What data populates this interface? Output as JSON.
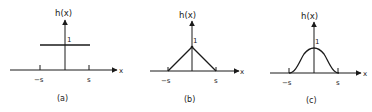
{
  "figure": {
    "panels": [
      {
        "id": "a",
        "caption": "(a)",
        "ylabel": "h(x)",
        "xlabel": "x",
        "peak_label": "1",
        "tick_neg": "−s",
        "tick_pos": "s",
        "shape": "rectangular"
      },
      {
        "id": "b",
        "caption": "(b)",
        "ylabel": "h(x)",
        "xlabel": "x",
        "peak_label": "1",
        "tick_neg": "−s",
        "tick_pos": "s",
        "shape": "triangular"
      },
      {
        "id": "c",
        "caption": "(c)",
        "ylabel": "h(x)",
        "xlabel": "x",
        "peak_label": "1",
        "tick_neg": "−s",
        "tick_pos": "s",
        "shape": "bell"
      }
    ],
    "colors": {
      "line": "#1a1a1a",
      "background": "#ffffff"
    }
  }
}
